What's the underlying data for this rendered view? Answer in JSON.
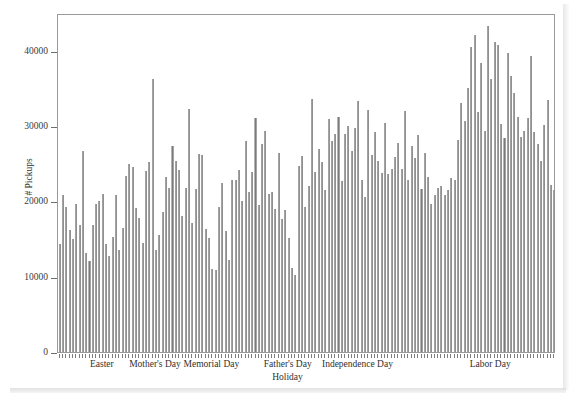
{
  "chart_data": {
    "type": "bar",
    "title": "",
    "xlabel": "Holiday",
    "ylabel": "# Pickups",
    "ylim": [
      0,
      45000
    ],
    "yticks": [
      0,
      10000,
      20000,
      30000,
      40000
    ],
    "ytick_labels": [
      "0",
      "10000",
      "20000",
      "30000",
      "40000"
    ],
    "grid": false,
    "legend": null,
    "bar_color": "#808080",
    "frame_color": "#9a9a9a",
    "xtick_labels": [
      {
        "label": "Easter",
        "index": 13
      },
      {
        "label": "Mother's Day",
        "index": 29
      },
      {
        "label": "Memorial Day",
        "index": 46
      },
      {
        "label": "Father's Day",
        "index": 69
      },
      {
        "label": "Independence Day",
        "index": 90
      },
      {
        "label": "Labor Day",
        "index": 130
      }
    ],
    "categories": [
      "1",
      "2",
      "3",
      "4",
      "5",
      "6",
      "7",
      "8",
      "9",
      "10",
      "11",
      "12",
      "13",
      "14",
      "15",
      "16",
      "17",
      "18",
      "19",
      "20",
      "21",
      "22",
      "23",
      "24",
      "25",
      "26",
      "27",
      "28",
      "29",
      "30",
      "31",
      "32",
      "33",
      "34",
      "35",
      "36",
      "37",
      "38",
      "39",
      "40",
      "41",
      "42",
      "43",
      "44",
      "45",
      "46",
      "47",
      "48",
      "49",
      "50",
      "51",
      "52",
      "53",
      "54",
      "55",
      "56",
      "57",
      "58",
      "59",
      "60",
      "61",
      "62",
      "63",
      "64",
      "65",
      "66",
      "67",
      "68",
      "69",
      "70",
      "71",
      "72",
      "73",
      "74",
      "75",
      "76",
      "77",
      "78",
      "79",
      "80",
      "81",
      "82",
      "83",
      "84",
      "85",
      "86",
      "87",
      "88",
      "89",
      "90",
      "91",
      "92",
      "93",
      "94",
      "95",
      "96",
      "97",
      "98",
      "99",
      "100",
      "101",
      "102",
      "103",
      "104",
      "105",
      "106",
      "107",
      "108",
      "109",
      "110",
      "111",
      "112",
      "113",
      "114",
      "115",
      "116",
      "117",
      "118",
      "119",
      "120",
      "121",
      "122",
      "123",
      "124",
      "125",
      "126",
      "127",
      "128",
      "129",
      "130",
      "131",
      "132",
      "133",
      "134",
      "135",
      "136",
      "137",
      "138",
      "139",
      "140",
      "141",
      "142",
      "143",
      "144",
      "145",
      "146",
      "147",
      "148",
      "149",
      "150"
    ],
    "values": [
      14400,
      20800,
      19300,
      16200,
      15000,
      19700,
      16800,
      26700,
      13200,
      12100,
      16900,
      19600,
      20100,
      21000,
      14400,
      12800,
      15300,
      20800,
      13600,
      16400,
      23300,
      24900,
      24600,
      19100,
      17800,
      14500,
      24000,
      25200,
      36300,
      13500,
      15500,
      18600,
      23200,
      21800,
      27300,
      25400,
      24100,
      18000,
      21800,
      32300,
      17100,
      21700,
      26300,
      26200,
      16300,
      15100,
      11000,
      10900,
      19200,
      22400,
      16000,
      12200,
      22900,
      22800,
      24100,
      20000,
      28000,
      21300,
      23900,
      31000,
      19500,
      27600,
      29300,
      21000,
      21200,
      19000,
      26400,
      17700,
      18800,
      15100,
      11200,
      10200,
      24700,
      26000,
      19200,
      22000,
      33600,
      23900,
      27000,
      25200,
      21500,
      30900,
      28000,
      29000,
      31200,
      22700,
      28900,
      30000,
      26700,
      29800,
      33300,
      22900,
      20600,
      32100,
      26200,
      29200,
      25400,
      23800,
      30400,
      23600,
      24300,
      25900,
      27700,
      24300,
      32000,
      22800,
      27400,
      25700,
      28800,
      21600,
      26400,
      23200,
      19700,
      20900,
      21800,
      22000,
      20800,
      21500,
      23100,
      22800,
      28100,
      33000,
      30600,
      35100,
      40500,
      42100,
      31800,
      38400,
      29400,
      43300,
      36300,
      41200,
      40700,
      30300,
      28400,
      39700,
      36600,
      34400,
      31200,
      28600,
      29300,
      31000,
      39300,
      29200,
      27600,
      25400,
      30100,
      33500,
      22200,
      21500
    ]
  }
}
